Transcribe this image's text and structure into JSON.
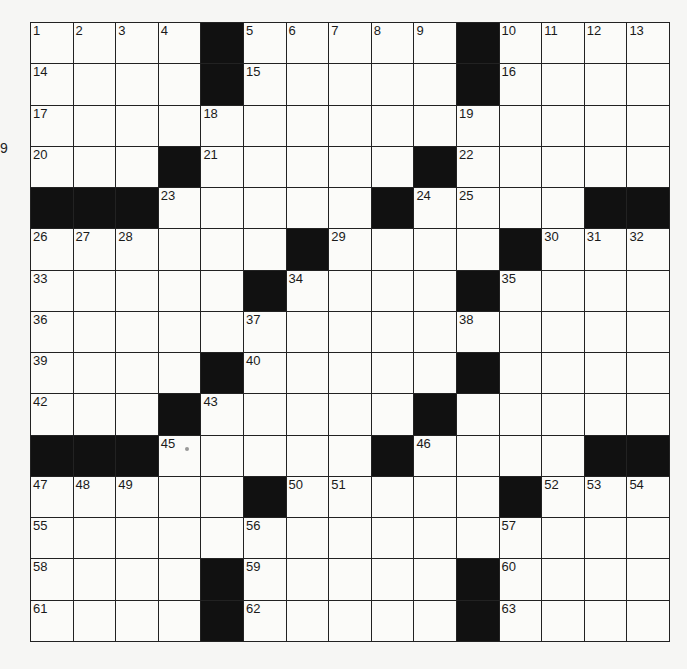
{
  "puzzle": {
    "rows": 15,
    "cols": 15,
    "layout": [
      "....#.....#....",
      "....#.....#....",
      "...............",
      "...#.....#.....",
      "###.....#....##",
      "......#....#...",
      ".....#....#....",
      "...............",
      "....#.....#....",
      "...#.....#.....",
      "###.....#....##",
      ".....#.....#...",
      "...............",
      "....#.....#....",
      "....#.....#...."
    ],
    "numbers": [
      [
        1,
        2,
        3,
        4,
        0,
        5,
        6,
        7,
        8,
        9,
        0,
        10,
        11,
        12,
        13
      ],
      [
        14,
        0,
        0,
        0,
        0,
        15,
        0,
        0,
        0,
        0,
        0,
        16,
        0,
        0,
        0
      ],
      [
        17,
        0,
        0,
        0,
        18,
        0,
        0,
        0,
        0,
        0,
        19,
        0,
        0,
        0,
        0
      ],
      [
        20,
        0,
        0,
        0,
        21,
        0,
        0,
        0,
        0,
        0,
        22,
        0,
        0,
        0,
        0
      ],
      [
        0,
        0,
        0,
        23,
        0,
        0,
        0,
        0,
        0,
        24,
        25,
        0,
        0,
        0,
        0
      ],
      [
        26,
        27,
        28,
        0,
        0,
        0,
        0,
        29,
        0,
        0,
        0,
        0,
        30,
        31,
        32
      ],
      [
        33,
        0,
        0,
        0,
        0,
        0,
        34,
        0,
        0,
        0,
        0,
        35,
        0,
        0,
        0
      ],
      [
        36,
        0,
        0,
        0,
        0,
        37,
        0,
        0,
        0,
        0,
        38,
        0,
        0,
        0,
        0
      ],
      [
        39,
        0,
        0,
        0,
        0,
        40,
        0,
        0,
        0,
        0,
        41,
        0,
        0,
        0,
        0
      ],
      [
        42,
        0,
        0,
        0,
        43,
        0,
        0,
        0,
        0,
        44,
        0,
        0,
        0,
        0,
        0
      ],
      [
        0,
        0,
        0,
        45,
        0,
        0,
        0,
        0,
        0,
        46,
        0,
        0,
        0,
        0,
        0
      ],
      [
        47,
        48,
        49,
        0,
        0,
        0,
        50,
        51,
        0,
        0,
        0,
        0,
        52,
        53,
        54
      ],
      [
        55,
        0,
        0,
        0,
        0,
        56,
        0,
        0,
        0,
        0,
        0,
        57,
        0,
        0,
        0
      ],
      [
        58,
        0,
        0,
        0,
        0,
        59,
        0,
        0,
        0,
        0,
        0,
        60,
        0,
        0,
        0
      ],
      [
        61,
        0,
        0,
        0,
        0,
        62,
        0,
        0,
        0,
        0,
        0,
        63,
        0,
        0,
        0
      ]
    ]
  },
  "edge_mark": "9"
}
